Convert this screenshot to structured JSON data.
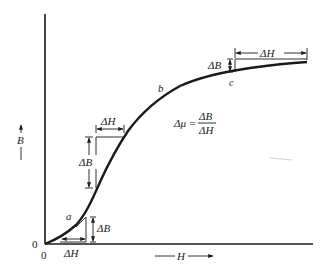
{
  "figure": {
    "type": "magnetization-curve",
    "axes": {
      "y_label": "B",
      "x_label": "H",
      "origin_x_label": "0",
      "origin_y_label": "0"
    },
    "points": {
      "a": "a",
      "b": "b",
      "c": "c"
    },
    "increments": {
      "low": {
        "delta_B": "ΔB",
        "delta_H": "ΔH"
      },
      "mid": {
        "delta_B": "ΔB",
        "delta_H": "ΔH"
      },
      "high": {
        "delta_B": "ΔB",
        "delta_H": "ΔH"
      }
    },
    "formula": {
      "lhs": "Δμ =",
      "numerator": "ΔB",
      "denominator": "ΔH"
    },
    "colors": {
      "ink": "#1a1a1a",
      "background": "#ffffff"
    }
  }
}
